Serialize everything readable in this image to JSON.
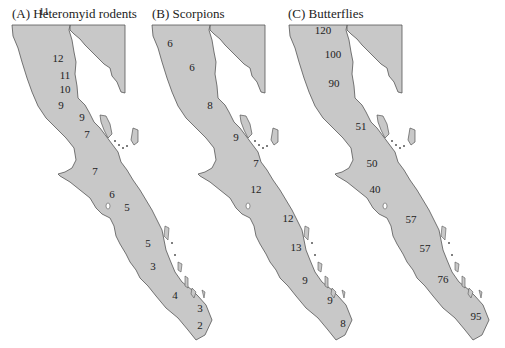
{
  "figure": {
    "land_color": "#c8c8c8",
    "outline_color": "#555555",
    "panels": [
      {
        "id": "A",
        "title": "(A) Heteromyid rodents",
        "counts": [
          {
            "value": "11",
            "x": 44,
            "y": 11
          },
          {
            "value": "12",
            "x": 58,
            "y": 58
          },
          {
            "value": "11",
            "x": 65,
            "y": 75
          },
          {
            "value": "10",
            "x": 65,
            "y": 89
          },
          {
            "value": "9",
            "x": 61,
            "y": 105
          },
          {
            "value": "9",
            "x": 82,
            "y": 117
          },
          {
            "value": "7",
            "x": 87,
            "y": 134
          },
          {
            "value": "7",
            "x": 95,
            "y": 171
          },
          {
            "value": "6",
            "x": 112,
            "y": 194
          },
          {
            "value": "5",
            "x": 127,
            "y": 207
          },
          {
            "value": "5",
            "x": 148,
            "y": 243
          },
          {
            "value": "3",
            "x": 153,
            "y": 266
          },
          {
            "value": "4",
            "x": 175,
            "y": 295
          },
          {
            "value": "3",
            "x": 200,
            "y": 308
          },
          {
            "value": "2",
            "x": 200,
            "y": 325
          }
        ]
      },
      {
        "id": "B",
        "title": "(B) Scorpions",
        "counts": [
          {
            "value": "6",
            "x": 170,
            "y": 43
          },
          {
            "value": "6",
            "x": 192,
            "y": 67
          },
          {
            "value": "8",
            "x": 210,
            "y": 105
          },
          {
            "value": "9",
            "x": 236,
            "y": 137
          },
          {
            "value": "7",
            "x": 256,
            "y": 163
          },
          {
            "value": "12",
            "x": 256,
            "y": 189
          },
          {
            "value": "12",
            "x": 288,
            "y": 218
          },
          {
            "value": "13",
            "x": 296,
            "y": 247
          },
          {
            "value": "9",
            "x": 305,
            "y": 280
          },
          {
            "value": "9",
            "x": 330,
            "y": 300
          },
          {
            "value": "8",
            "x": 343,
            "y": 323
          }
        ]
      },
      {
        "id": "C",
        "title": "(C) Butterflies",
        "counts": [
          {
            "value": "120",
            "x": 323,
            "y": 30
          },
          {
            "value": "100",
            "x": 333,
            "y": 54
          },
          {
            "value": "90",
            "x": 334,
            "y": 83
          },
          {
            "value": "51",
            "x": 361,
            "y": 126
          },
          {
            "value": "50",
            "x": 372,
            "y": 163
          },
          {
            "value": "40",
            "x": 375,
            "y": 189
          },
          {
            "value": "57",
            "x": 411,
            "y": 219
          },
          {
            "value": "57",
            "x": 425,
            "y": 248
          },
          {
            "value": "76",
            "x": 443,
            "y": 279
          },
          {
            "value": "95",
            "x": 476,
            "y": 316
          }
        ]
      }
    ]
  }
}
